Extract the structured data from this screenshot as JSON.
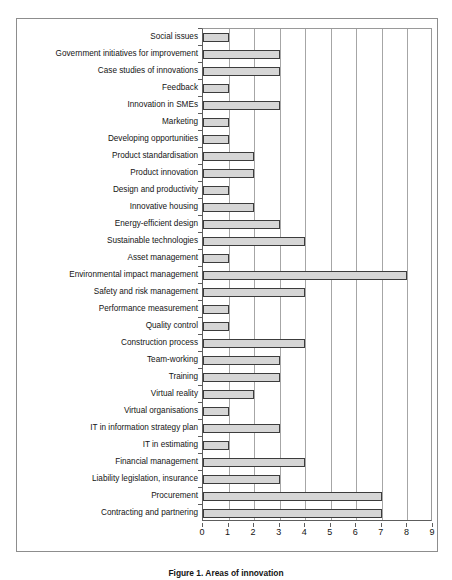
{
  "figure": {
    "caption": "Figure 1. Areas of innovation",
    "frame_border_color": "#8d8d8d"
  },
  "chart_data": {
    "type": "bar",
    "orientation": "horizontal",
    "title": "",
    "subtitle": "",
    "xlabel": "",
    "ylabel": "",
    "xlim": [
      0,
      9
    ],
    "ylim": null,
    "grid": true,
    "legend": null,
    "legend_position": "none",
    "xticks": [
      0,
      1,
      2,
      3,
      4,
      5,
      6,
      7,
      8,
      9
    ],
    "bar_fill_color": "#d6d6d6",
    "bar_border_color": "#3c3c3c",
    "gridline_color": "#a6a6a6",
    "axis_color": "#5d5d5d",
    "categories": [
      "Social issues",
      "Government initiatives for improvement",
      "Case studies of innovations",
      "Feedback",
      "Innovation in SMEs",
      "Marketing",
      "Developing opportunities",
      "Product standardisation",
      "Product innovation",
      "Design and productivity",
      "Innovative housing",
      "Energy-efficient design",
      "Sustainable technologies",
      "Asset management",
      "Environmental impact management",
      "Safety and risk management",
      "Performance measurement",
      "Quality control",
      "Construction process",
      "Team-working",
      "Training",
      "Virtual reality",
      "Virtual organisations",
      "IT in information strategy plan",
      "IT in estimating",
      "Financial management",
      "Liability legislation, insurance",
      "Procurement",
      "Contracting and partnering"
    ],
    "values": [
      1,
      3,
      3,
      1,
      3,
      1,
      1,
      2,
      2,
      1,
      2,
      3,
      4,
      1,
      8,
      4,
      1,
      1,
      4,
      3,
      3,
      2,
      1,
      3,
      1,
      4,
      3,
      7,
      7
    ]
  }
}
